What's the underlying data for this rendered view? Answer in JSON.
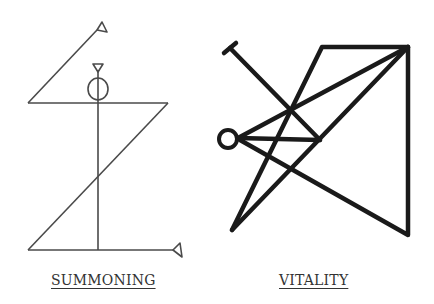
{
  "figures": [
    {
      "id": "summoning",
      "label": "SUMMONING",
      "stroke": "#444444",
      "stroke_weight": "thin"
    },
    {
      "id": "vitality",
      "label": "VITALITY",
      "stroke": "#1a1a1a",
      "stroke_weight": "thick"
    }
  ],
  "background": "#ffffff"
}
